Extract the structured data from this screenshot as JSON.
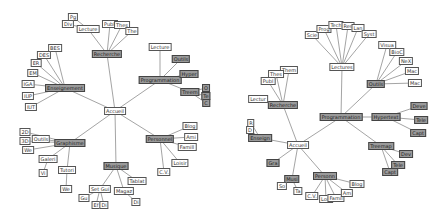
{
  "left_tree": {
    "root": {
      "label": "Accueil",
      "x": 115,
      "y": 111
    },
    "nodes": [
      {
        "id": "ens",
        "label": "Enseignement",
        "x": 65,
        "y": 88,
        "dark": true,
        "parent": "root"
      },
      {
        "id": "rech",
        "label": "Recherche",
        "x": 107,
        "y": 54,
        "dark": true,
        "parent": "root"
      },
      {
        "id": "prog",
        "label": "Programmation",
        "x": 160,
        "y": 80,
        "dark": true,
        "parent": "root"
      },
      {
        "id": "graph",
        "label": "Graphisme",
        "x": 70,
        "y": 143,
        "dark": true,
        "parent": "root"
      },
      {
        "id": "mus",
        "label": "Musique",
        "x": 116,
        "y": 166,
        "dark": true,
        "parent": "root"
      },
      {
        "id": "pers",
        "label": "Personnel",
        "x": 160,
        "y": 139,
        "dark": true,
        "parent": "root"
      },
      {
        "id": "bes",
        "label": "BES",
        "x": 55,
        "y": 48,
        "parent": "ens"
      },
      {
        "id": "des",
        "label": "DES",
        "x": 44,
        "y": 55,
        "parent": "ens"
      },
      {
        "id": "er",
        "label": "ER",
        "x": 36,
        "y": 63,
        "parent": "ens"
      },
      {
        "id": "em",
        "label": "EM",
        "x": 33,
        "y": 73,
        "parent": "ens"
      },
      {
        "id": "iga",
        "label": "IGA",
        "x": 28,
        "y": 84,
        "parent": "ens"
      },
      {
        "id": "iup",
        "label": "IUP",
        "x": 28,
        "y": 96,
        "parent": "ens"
      },
      {
        "id": "iut",
        "label": "IUT",
        "x": 31,
        "y": 107,
        "parent": "ens"
      },
      {
        "id": "lect1",
        "label": "Lecture",
        "x": 88,
        "y": 29,
        "parent": "rech"
      },
      {
        "id": "pg",
        "label": "Pg",
        "x": 73,
        "y": 17,
        "parent": "lect1"
      },
      {
        "id": "div",
        "label": "Div",
        "x": 68,
        "y": 24,
        "parent": "lect1"
      },
      {
        "id": "publ",
        "label": "Publi",
        "x": 110,
        "y": 24,
        "parent": "rech"
      },
      {
        "id": "thes",
        "label": "Thes",
        "x": 122,
        "y": 25,
        "parent": "rech"
      },
      {
        "id": "the",
        "label": "The",
        "x": 132,
        "y": 31,
        "parent": "rech"
      },
      {
        "id": "lect2",
        "label": "Lecture",
        "x": 160,
        "y": 47,
        "parent": "prog"
      },
      {
        "id": "outils",
        "label": "Outils",
        "x": 181,
        "y": 59,
        "dark": true,
        "parent": "prog"
      },
      {
        "id": "hyper",
        "label": "Hyper",
        "x": 189,
        "y": 74,
        "dark": true,
        "parent": "prog"
      },
      {
        "id": "treem",
        "label": "Treem",
        "x": 190,
        "y": 92,
        "dark": true,
        "parent": "prog"
      },
      {
        "id": "o",
        "label": "O",
        "x": 206,
        "y": 88,
        "dark": true,
        "parent": "treem"
      },
      {
        "id": "te",
        "label": "Te",
        "x": 206,
        "y": 96,
        "dark": true,
        "parent": "treem"
      },
      {
        "id": "c",
        "label": "C",
        "x": 206,
        "y": 103,
        "dark": true,
        "parent": "treem"
      },
      {
        "id": "2d",
        "label": "2D",
        "x": 25,
        "y": 132,
        "parent": "graph"
      },
      {
        "id": "3d",
        "label": "3D",
        "x": 25,
        "y": 141,
        "parent": "graph"
      },
      {
        "id": "we",
        "label": "We",
        "x": 28,
        "y": 150,
        "parent": "graph"
      },
      {
        "id": "outils2",
        "label": "Outils",
        "x": 41,
        "y": 139,
        "parent": "graph"
      },
      {
        "id": "galeri",
        "label": "Galeri",
        "x": 48,
        "y": 159,
        "parent": "graph"
      },
      {
        "id": "tutori",
        "label": "Tutori",
        "x": 67,
        "y": 170,
        "parent": "graph"
      },
      {
        "id": "vi",
        "label": "Vi",
        "x": 43,
        "y": 173,
        "parent": "galeri"
      },
      {
        "id": "we2",
        "label": "We",
        "x": 66,
        "y": 189,
        "parent": "tutori"
      },
      {
        "id": "setgui",
        "label": "Set Gui",
        "x": 100,
        "y": 189,
        "parent": "mus"
      },
      {
        "id": "magaz",
        "label": "Magaz",
        "x": 124,
        "y": 191,
        "parent": "mus"
      },
      {
        "id": "tablat",
        "label": "Tablat",
        "x": 137,
        "y": 181,
        "parent": "mus"
      },
      {
        "id": "gu",
        "label": "Gu",
        "x": 84,
        "y": 198,
        "parent": "setgui"
      },
      {
        "id": "ef",
        "label": "Ef",
        "x": 96,
        "y": 205,
        "parent": "setgui"
      },
      {
        "id": "di",
        "label": "Di",
        "x": 104,
        "y": 205,
        "parent": "setgui"
      },
      {
        "id": "di2",
        "label": "Di",
        "x": 136,
        "y": 202,
        "parent": "magaz"
      },
      {
        "id": "blog",
        "label": "Blog",
        "x": 190,
        "y": 126,
        "parent": "pers"
      },
      {
        "id": "ami",
        "label": "Ami",
        "x": 191,
        "y": 137,
        "parent": "pers"
      },
      {
        "id": "famill",
        "label": "Famill",
        "x": 187,
        "y": 147,
        "parent": "pers"
      },
      {
        "id": "loisir",
        "label": "Loisir",
        "x": 180,
        "y": 163,
        "parent": "pers"
      },
      {
        "id": "cv",
        "label": "C.V.",
        "x": 164,
        "y": 172,
        "parent": "pers"
      }
    ]
  },
  "right_tree": {
    "root": {
      "label": "Accueil",
      "x": 76,
      "y": 145
    },
    "nodes": [
      {
        "id": "rech",
        "label": "Recherche",
        "x": 61,
        "y": 105,
        "dark": true,
        "parent": "root"
      },
      {
        "id": "prog",
        "label": "Programmation",
        "x": 119,
        "y": 117,
        "dark": true,
        "parent": "root"
      },
      {
        "id": "ens",
        "label": "Enseign",
        "x": 38,
        "y": 138,
        "dark": true,
        "parent": "root"
      },
      {
        "id": "gra",
        "label": "Gra",
        "x": 51,
        "y": 163,
        "dark": true,
        "parent": "root"
      },
      {
        "id": "musi",
        "label": "Musi",
        "x": 70,
        "y": 179,
        "dark": true,
        "parent": "root"
      },
      {
        "id": "person",
        "label": "Personn",
        "x": 103,
        "y": 176,
        "dark": true,
        "parent": "root"
      },
      {
        "id": "lectures",
        "label": "Lectures",
        "x": 120,
        "y": 67,
        "parent": "prog"
      },
      {
        "id": "outils",
        "label": "Outils",
        "x": 154,
        "y": 84,
        "dark": true,
        "parent": "prog"
      },
      {
        "id": "hypert",
        "label": "Hypertext",
        "x": 164,
        "y": 117,
        "dark": true,
        "parent": "prog"
      },
      {
        "id": "treemap",
        "label": "Treemap",
        "x": 159,
        "y": 146,
        "dark": true,
        "parent": "prog"
      },
      {
        "id": "scie",
        "label": "Scie",
        "x": 90,
        "y": 35,
        "parent": "lectures"
      },
      {
        "id": "prog2",
        "label": "Prog",
        "x": 102,
        "y": 29,
        "parent": "lectures"
      },
      {
        "id": "tech",
        "label": "Tech",
        "x": 114,
        "y": 25,
        "parent": "lectures"
      },
      {
        "id": "res",
        "label": "Res",
        "x": 126,
        "y": 26,
        "parent": "lectures"
      },
      {
        "id": "lan",
        "label": "Lan",
        "x": 136,
        "y": 28,
        "parent": "lectures"
      },
      {
        "id": "syst",
        "label": "Syst",
        "x": 147,
        "y": 34,
        "parent": "lectures"
      },
      {
        "id": "visua",
        "label": "Visua",
        "x": 165,
        "y": 45,
        "parent": "outils"
      },
      {
        "id": "bioc",
        "label": "BioC",
        "x": 175,
        "y": 52,
        "parent": "outils"
      },
      {
        "id": "next",
        "label": "NeX",
        "x": 184,
        "y": 61,
        "parent": "outils"
      },
      {
        "id": "mac1",
        "label": "Mac",
        "x": 190,
        "y": 71,
        "parent": "outils"
      },
      {
        "id": "mac2",
        "label": "Mac",
        "x": 193,
        "y": 83,
        "parent": "outils"
      },
      {
        "id": "dev",
        "label": "Deve",
        "x": 197,
        "y": 106,
        "dark": true,
        "parent": "hypert"
      },
      {
        "id": "tele",
        "label": "Tele",
        "x": 199,
        "y": 120,
        "dark": true,
        "parent": "hypert"
      },
      {
        "id": "capt",
        "label": "Capt",
        "x": 196,
        "y": 133,
        "dark": true,
        "parent": "hypert"
      },
      {
        "id": "dev2",
        "label": "Dev",
        "x": 184,
        "y": 154,
        "dark": true,
        "parent": "treemap"
      },
      {
        "id": "tele2",
        "label": "Tele",
        "x": 176,
        "y": 165,
        "dark": true,
        "parent": "treemap"
      },
      {
        "id": "capt2",
        "label": "Capt",
        "x": 168,
        "y": 172,
        "dark": true,
        "parent": "treemap"
      },
      {
        "id": "them",
        "label": "Them",
        "x": 67,
        "y": 70,
        "parent": "rech"
      },
      {
        "id": "thes",
        "label": "Thes",
        "x": 54,
        "y": 74,
        "parent": "rech"
      },
      {
        "id": "publ",
        "label": "Publ",
        "x": 46,
        "y": 81,
        "parent": "rech"
      },
      {
        "id": "lectur",
        "label": "Lectur",
        "x": 36,
        "y": 99,
        "parent": "rech"
      },
      {
        "id": "r",
        "label": "R",
        "x": 29,
        "y": 123,
        "parent": "ens"
      },
      {
        "id": "d",
        "label": "D",
        "x": 28,
        "y": 130,
        "parent": "ens"
      },
      {
        "id": "so",
        "label": "So",
        "x": 60,
        "y": 186,
        "parent": "musi"
      },
      {
        "id": "ta",
        "label": "Ta",
        "x": 76,
        "y": 191,
        "parent": "musi"
      },
      {
        "id": "cv",
        "label": "C.V.",
        "x": 90,
        "y": 196,
        "parent": "person"
      },
      {
        "id": "lois",
        "label": "Lois",
        "x": 104,
        "y": 199,
        "parent": "person"
      },
      {
        "id": "famil",
        "label": "Famil",
        "x": 114,
        "y": 198,
        "parent": "person"
      },
      {
        "id": "am",
        "label": "Am",
        "x": 125,
        "y": 193,
        "parent": "person"
      },
      {
        "id": "blog",
        "label": "Blog",
        "x": 135,
        "y": 184,
        "parent": "person"
      }
    ]
  }
}
